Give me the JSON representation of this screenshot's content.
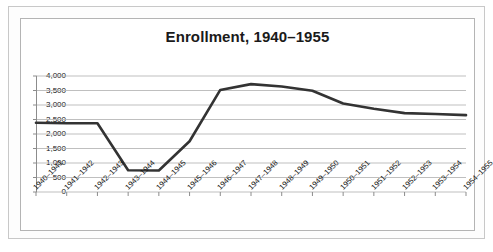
{
  "chart_data": {
    "type": "line",
    "title": "Enrollment, 1940–1955",
    "xlabel": "",
    "ylabel": "",
    "categories": [
      "1940–1941",
      "1941–1942",
      "1942–1943",
      "1943–1944",
      "1944–1945",
      "1945–1946",
      "1946–1947",
      "1947–1948",
      "1948–1949",
      "1949–1950",
      "1950–1951",
      "1951–1952",
      "1952–1953",
      "1953–1954",
      "1954–1955"
    ],
    "values": [
      2390,
      2370,
      2370,
      750,
      740,
      1750,
      3520,
      3720,
      3640,
      3490,
      3050,
      2870,
      2720,
      2690,
      2650
    ],
    "ylim": [
      0,
      4000
    ],
    "ytick_step": 500,
    "ytick_labels": [
      "0",
      "500",
      "1,000",
      "1,500",
      "2,000",
      "2,500",
      "3,000",
      "3,500",
      "4,000"
    ],
    "ytick_values": [
      0,
      500,
      1000,
      1500,
      2000,
      2500,
      3000,
      3500,
      4000
    ],
    "grid": true,
    "grid_axis": "y",
    "legend": false,
    "legend_position": "none",
    "series_color": "#333333",
    "grid_color": "#b8b8b8",
    "axis_color": "#8c8c8c",
    "line_width": 2.6,
    "markers": false
  },
  "frame": {
    "outer_border_color": "#c8c8c8",
    "inner_border_color": "#b4b4b4",
    "background": "#ffffff"
  }
}
